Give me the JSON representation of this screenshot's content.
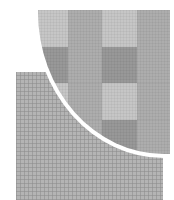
{
  "figure": {
    "colors": {
      "background": "#ffffff",
      "fine_grid": "#b4b4b4",
      "lens_ring": "#ffffff",
      "cell_light": "#c6c6c6",
      "cell_medium": "#adadad",
      "cell_dark": "#989898"
    },
    "magnified_cells": {
      "columns": [
        {
          "x": 0,
          "w": 30
        },
        {
          "x": 30,
          "w": 34
        },
        {
          "x": 64,
          "w": 35
        },
        {
          "x": 99,
          "w": 33
        }
      ],
      "rows": [
        {
          "y": 0,
          "h": 37
        },
        {
          "y": 37,
          "h": 36
        },
        {
          "y": 73,
          "h": 37
        },
        {
          "y": 110,
          "h": 34
        }
      ],
      "shades": [
        [
          "light",
          "medium",
          "light",
          "medium"
        ],
        [
          "dark",
          "medium",
          "dark",
          "medium"
        ],
        [
          "light",
          "medium",
          "light",
          "medium"
        ],
        [
          "dark",
          "medium",
          "dark",
          "medium"
        ]
      ]
    }
  }
}
